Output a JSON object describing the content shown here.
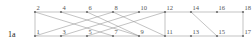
{
  "figure": {
    "label": "1a",
    "label_pos": {
      "x": 8,
      "y": 31
    },
    "width": 252,
    "height": 46,
    "background": "#ffffff"
  },
  "style": {
    "edge_color": "#9a9a9a",
    "edge_width": 0.6,
    "node_color": "#6e6e6e",
    "node_radius": 1.1,
    "node_label_color": "#555555",
    "node_label_size": 6.5,
    "top_row_y": 12,
    "bottom_row_y": 36
  },
  "graph": {
    "type": "bipartite-ladder-graph",
    "columns_x": [
      35,
      56,
      77,
      98,
      119,
      140,
      161,
      182,
      203,
      224,
      245
    ],
    "nodes": [
      {
        "id": 1,
        "label": "1",
        "x": 35,
        "y": 36,
        "row": "bottom"
      },
      {
        "id": 2,
        "label": "2",
        "x": 35,
        "y": 12,
        "row": "top"
      },
      {
        "id": 3,
        "label": "3",
        "x": 61,
        "y": 36,
        "row": "bottom"
      },
      {
        "id": 4,
        "label": "4",
        "x": 61,
        "y": 12,
        "row": "top"
      },
      {
        "id": 5,
        "label": "5",
        "x": 87,
        "y": 36,
        "row": "bottom"
      },
      {
        "id": 6,
        "label": "6",
        "x": 87,
        "y": 12,
        "row": "top"
      },
      {
        "id": 7,
        "label": "7",
        "x": 113,
        "y": 36,
        "row": "bottom"
      },
      {
        "id": 8,
        "label": "8",
        "x": 113,
        "y": 12,
        "row": "top"
      },
      {
        "id": 9,
        "label": "9",
        "x": 139,
        "y": 36,
        "row": "bottom"
      },
      {
        "id": 10,
        "label": "10",
        "x": 139,
        "y": 12,
        "row": "top"
      },
      {
        "id": 11,
        "label": "11",
        "x": 165,
        "y": 36,
        "row": "bottom"
      },
      {
        "id": 12,
        "label": "12",
        "x": 165,
        "y": 12,
        "row": "top"
      },
      {
        "id": 13,
        "label": "13",
        "x": 191,
        "y": 36,
        "row": "bottom"
      },
      {
        "id": 14,
        "label": "14",
        "x": 191,
        "y": 12,
        "row": "top"
      },
      {
        "id": 15,
        "label": "15",
        "x": 217,
        "y": 36,
        "row": "bottom"
      },
      {
        "id": 16,
        "label": "16",
        "x": 217,
        "y": 12,
        "row": "top"
      },
      {
        "id": 17,
        "label": "17",
        "x": 243,
        "y": 36,
        "row": "bottom"
      },
      {
        "id": 18,
        "label": "18",
        "x": 243,
        "y": 12,
        "row": "top"
      }
    ],
    "edges": [
      {
        "from": 1,
        "to": 2,
        "kind": "vertical"
      },
      {
        "from": 11,
        "to": 12,
        "kind": "vertical"
      },
      {
        "from": 17,
        "to": 18,
        "kind": "vertical"
      },
      {
        "from": 2,
        "to": 4,
        "kind": "horizontal-top"
      },
      {
        "from": 4,
        "to": 6,
        "kind": "horizontal-top"
      },
      {
        "from": 6,
        "to": 8,
        "kind": "horizontal-top"
      },
      {
        "from": 8,
        "to": 10,
        "kind": "horizontal-top"
      },
      {
        "from": 10,
        "to": 12,
        "kind": "horizontal-top"
      },
      {
        "from": 12,
        "to": 14,
        "kind": "horizontal-top"
      },
      {
        "from": 14,
        "to": 16,
        "kind": "horizontal-top"
      },
      {
        "from": 16,
        "to": 18,
        "kind": "horizontal-top"
      },
      {
        "from": 1,
        "to": 3,
        "kind": "horizontal-bottom"
      },
      {
        "from": 3,
        "to": 5,
        "kind": "horizontal-bottom"
      },
      {
        "from": 5,
        "to": 7,
        "kind": "horizontal-bottom"
      },
      {
        "from": 7,
        "to": 9,
        "kind": "horizontal-bottom"
      },
      {
        "from": 9,
        "to": 11,
        "kind": "horizontal-bottom"
      },
      {
        "from": 11,
        "to": 13,
        "kind": "horizontal-bottom"
      },
      {
        "from": 13,
        "to": 15,
        "kind": "horizontal-bottom"
      },
      {
        "from": 15,
        "to": 17,
        "kind": "horizontal-bottom"
      },
      {
        "from": 2,
        "to": 7,
        "kind": "diagonal"
      },
      {
        "from": 1,
        "to": 8,
        "kind": "diagonal"
      },
      {
        "from": 3,
        "to": 10,
        "kind": "diagonal"
      },
      {
        "from": 5,
        "to": 12,
        "kind": "diagonal"
      },
      {
        "from": 6,
        "to": 9,
        "kind": "diagonal"
      },
      {
        "from": 8,
        "to": 11,
        "kind": "diagonal"
      },
      {
        "from": 4,
        "to": 9,
        "kind": "diagonal"
      },
      {
        "from": 14,
        "to": 15,
        "kind": "diagonal"
      }
    ]
  }
}
